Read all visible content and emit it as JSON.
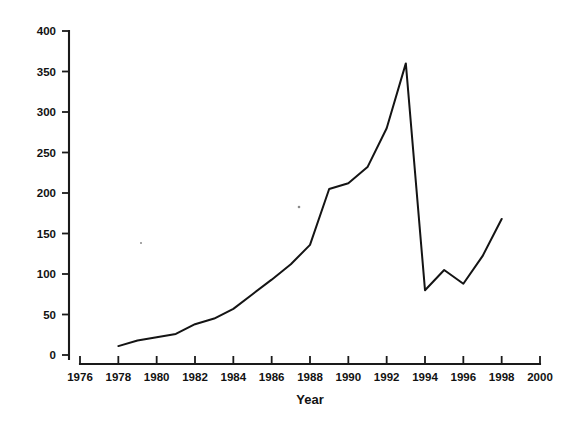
{
  "chart_data": {
    "type": "line",
    "title": "",
    "subtitle": "",
    "xlabel": "Year",
    "ylabel": "",
    "xlim": [
      1976,
      2000
    ],
    "ylim": [
      0,
      400
    ],
    "grid": false,
    "legend": false,
    "legend_position": "none",
    "xticks": [
      1976,
      1978,
      1980,
      1982,
      1984,
      1986,
      1988,
      1990,
      1992,
      1994,
      1996,
      1998,
      2000
    ],
    "xtick_labels": [
      "1976",
      "1978",
      "1980",
      "1982",
      "1984",
      "1986",
      "1988",
      "1990",
      "1992",
      "1994",
      "1996",
      "1998",
      "2000"
    ],
    "yticks": [
      0,
      50,
      100,
      150,
      200,
      250,
      300,
      350,
      400
    ],
    "ytick_labels": [
      "0",
      "50",
      "100",
      "150",
      "200",
      "250",
      "300",
      "350",
      "400"
    ],
    "series": [
      {
        "name": "series-1",
        "color": "#141414",
        "x": [
          1978,
          1979,
          1980,
          1981,
          1982,
          1983,
          1984,
          1985,
          1986,
          1987,
          1988,
          1989,
          1990,
          1991,
          1992,
          1993,
          1994,
          1995,
          1996,
          1997,
          1998
        ],
        "values": [
          11,
          18,
          22,
          26,
          38,
          45,
          57,
          75,
          93,
          112,
          136,
          205,
          212,
          232,
          280,
          360,
          80,
          105,
          88,
          122,
          168
        ]
      }
    ],
    "annotations": []
  },
  "axes": {
    "x_axis_title": "Year",
    "y_axis_title": ""
  }
}
